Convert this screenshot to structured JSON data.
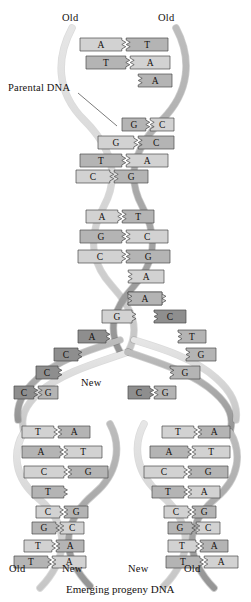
{
  "figure": {
    "caption": "Emerging progeny DNA",
    "labels": {
      "top_left": "Old",
      "top_right": "Old",
      "parental": "Parental DNA",
      "fork_new": "New",
      "bottom_left_old": "Old",
      "bottom_left_new": "New",
      "bottom_right_new": "New",
      "bottom_right_old": "Old"
    }
  },
  "colors": {
    "backbone_light": "#d9d9d9",
    "backbone_dark": "#a8a8a8",
    "base_light": "#d2d2d2",
    "base_mid": "#b4b4b4",
    "base_dark": "#8e8e8e",
    "outline": "#4a4a4a",
    "text": "#15110f",
    "background": "#ffffff"
  },
  "parental_helix": {
    "segment_1": [
      {
        "left": "A",
        "right": "T"
      },
      {
        "left": "T",
        "right": "A"
      },
      {
        "left": "",
        "right": "A"
      }
    ],
    "segment_2": [
      {
        "left": "G",
        "right": "C"
      },
      {
        "left": "G",
        "right": "C"
      },
      {
        "left": "T",
        "right": "A"
      },
      {
        "left": "C",
        "right": "G"
      }
    ],
    "segment_3": [
      {
        "left": "A",
        "right": "T"
      },
      {
        "left": "G",
        "right": "C"
      },
      {
        "left": "C",
        "right": "G"
      },
      {
        "left": "",
        "right": "A"
      }
    ]
  },
  "replication_fork": {
    "unpaired_left": [
      "A",
      "G",
      "A",
      "C",
      "C"
    ],
    "unpaired_right": [
      "A",
      "C",
      "T",
      "G",
      "G"
    ],
    "left_rejoin": {
      "left": "C",
      "right": "G"
    },
    "right_rejoin": {
      "left": "C",
      "right": "G"
    }
  },
  "progeny_left": [
    {
      "left": "T",
      "right": "A"
    },
    {
      "left": "A",
      "right": "T"
    },
    {
      "left": "C",
      "right": "G"
    },
    {
      "left": "T",
      "right": ""
    },
    {
      "left": "C",
      "right": "G"
    },
    {
      "left": "G",
      "right": "C"
    },
    {
      "left": "T",
      "right": "A"
    },
    {
      "left": "T",
      "right": "A"
    }
  ],
  "progeny_right": [
    {
      "left": "T",
      "right": "A"
    },
    {
      "left": "A",
      "right": "T"
    },
    {
      "left": "C",
      "right": "G"
    },
    {
      "left": "T",
      "right": "A"
    },
    {
      "left": "C",
      "right": "G"
    },
    {
      "left": "G",
      "right": "C"
    },
    {
      "left": "T",
      "right": "A"
    },
    {
      "left": "T",
      "right": "A"
    }
  ]
}
